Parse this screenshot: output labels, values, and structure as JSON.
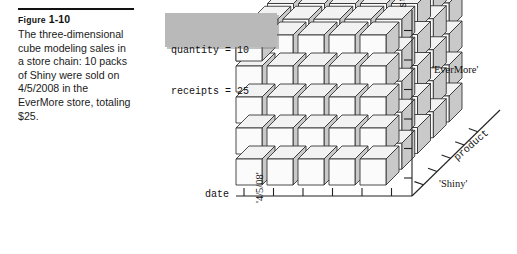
{
  "figure": {
    "label_prefix": "Figure",
    "label_number": "1-10",
    "caption": "The three-dimensional cube modeling sales in a store chain: 10 packs of Shiny were sold on 4/5/2008 in the EverMore store, totaling $25."
  },
  "callout": {
    "line1": "quantity = 10",
    "line2": "receipts = 25",
    "background": "#b9b9b9"
  },
  "chart_data": {
    "type": "scatter",
    "title": "",
    "subtitle": "",
    "render": "3d-cube-lattice",
    "grid": false,
    "legend_position": "none",
    "cube": {
      "nx": 5,
      "ny": 5,
      "nz": 5,
      "cell_px": 26,
      "gap_px": 5,
      "depth_dx_px": 13,
      "depth_dy_px": -13,
      "origin_x_px": 236,
      "origin_y_px": 185,
      "face_top": "#f2f2f2",
      "face_left": "#fbfbfb",
      "face_right": "#c9c9c9",
      "stroke": "#2a2a2a"
    },
    "axes": [
      {
        "name": "date",
        "label": "date",
        "orientation": "horizontal",
        "ticks": 6,
        "tick_labels": [
          "'4/5/08'"
        ],
        "highlighted_tick_index": 1
      },
      {
        "name": "store",
        "label": "store",
        "orientation": "vertical",
        "ticks": 6,
        "tick_labels": [
          "'EverMore'"
        ],
        "highlighted_tick_index": 2
      },
      {
        "name": "product",
        "label": "product",
        "orientation": "diagonal",
        "ticks": 5,
        "tick_labels": [
          "'Shiny'"
        ],
        "highlighted_tick_index": 0
      }
    ],
    "highlighted_cell": {
      "date": "'4/5/08'",
      "store": "'EverMore'",
      "product": "'Shiny'",
      "quantity": 10,
      "receipts": 25
    },
    "axis_color": "#222222"
  }
}
